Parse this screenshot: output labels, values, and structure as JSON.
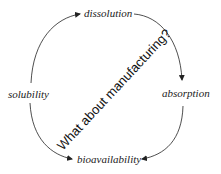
{
  "diagram": {
    "nodes": {
      "top": "dissolution",
      "left": "solubility",
      "right": "absorption",
      "bottom": "bioavailability"
    },
    "center_note": "What about manufacturing?",
    "edges": [
      {
        "from": "solubility",
        "to": "dissolution"
      },
      {
        "from": "dissolution",
        "to": "absorption"
      },
      {
        "from": "absorption",
        "to": "bioavailability"
      },
      {
        "from": "solubility",
        "to": "bioavailability"
      }
    ],
    "colors": {
      "line": "#222222",
      "text": "#222222"
    }
  }
}
